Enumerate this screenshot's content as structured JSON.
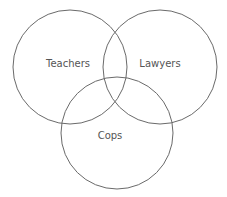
{
  "diagram": {
    "type": "venn",
    "sets": [
      {
        "label": "Teachers",
        "cx": 70,
        "cy": 67,
        "r": 57,
        "label_x": 68,
        "label_y": 67
      },
      {
        "label": "Lawyers",
        "cx": 160,
        "cy": 67,
        "r": 57,
        "label_x": 160,
        "label_y": 67
      },
      {
        "label": "Cops",
        "cx": 117,
        "cy": 133,
        "r": 56,
        "label_x": 110,
        "label_y": 139
      }
    ],
    "stroke_color": "#6a6a6a",
    "label_color": "#555555",
    "background": "#ffffff"
  }
}
